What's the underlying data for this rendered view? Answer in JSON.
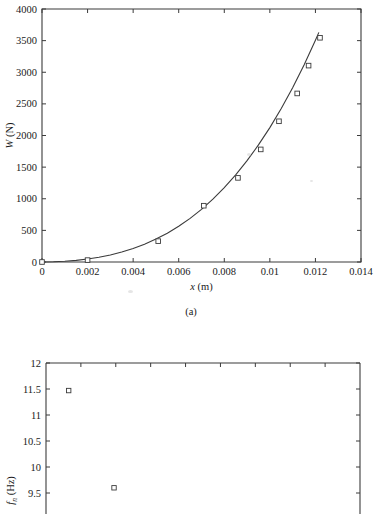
{
  "figure": {
    "caption_a": "(a)"
  },
  "chart_data": [
    {
      "id": "panel-a",
      "type": "scatter",
      "title": "",
      "xlabel": "x (m)",
      "xlabel_symbol": "x",
      "xlabel_unit": "(m)",
      "ylabel": "W (N)",
      "ylabel_symbol": "W",
      "ylabel_unit": "(N)",
      "xlim": [
        0,
        0.014
      ],
      "ylim": [
        0,
        4000
      ],
      "xticks": [
        0,
        0.002,
        0.004,
        0.006,
        0.008,
        0.01,
        0.012,
        0.014
      ],
      "xticklabels": [
        "0",
        "0.002",
        "0.004",
        "0.006",
        "0.008",
        "0.01",
        "0.012",
        "0.014"
      ],
      "yticks": [
        0,
        500,
        1000,
        1500,
        2000,
        2500,
        3000,
        3500,
        4000
      ],
      "yticklabels": [
        "0",
        "500",
        "1000",
        "1500",
        "2000",
        "2500",
        "3000",
        "3500",
        "4000"
      ],
      "grid": false,
      "legend": null,
      "marker": "open-square",
      "series": [
        {
          "name": "measured",
          "style": "markers",
          "x": [
            0.0,
            0.002,
            0.0051,
            0.0071,
            0.0086,
            0.0096,
            0.0104,
            0.0112,
            0.0117,
            0.0122
          ],
          "y": [
            0,
            30,
            330,
            890,
            1330,
            1780,
            2225,
            2665,
            3105,
            3545
          ]
        },
        {
          "name": "fitted curve",
          "style": "line",
          "x": [
            0.0,
            0.0005,
            0.001,
            0.0015,
            0.002,
            0.0025,
            0.003,
            0.0035,
            0.004,
            0.0045,
            0.005,
            0.0055,
            0.006,
            0.0065,
            0.007,
            0.0075,
            0.008,
            0.0085,
            0.009,
            0.0095,
            0.01,
            0.0105,
            0.011,
            0.0115,
            0.012,
            0.01215
          ],
          "y": [
            0,
            3,
            11,
            26,
            47,
            75,
            112,
            158,
            214,
            282,
            362,
            456,
            565,
            690,
            833,
            994,
            1175,
            1377,
            1602,
            1851,
            2125,
            2426,
            2756,
            3115,
            3506,
            3630
          ]
        }
      ]
    },
    {
      "id": "panel-b",
      "type": "scatter",
      "title": "",
      "xlabel": "",
      "ylabel": "f_n (Hz)",
      "ylabel_symbol": "f",
      "ylabel_subscript": "n",
      "ylabel_unit": "(Hz)",
      "ylim": [
        9,
        12
      ],
      "yticks": [
        9,
        9.5,
        10,
        10.5,
        11,
        11.5,
        12
      ],
      "yticklabels": [
        "9",
        "9.5",
        "10",
        "10.5",
        "11",
        "11.5",
        "12"
      ],
      "xlim": [
        0,
        9
      ],
      "xticks": [
        0,
        1,
        2,
        3,
        4,
        5,
        6,
        7,
        8,
        9
      ],
      "xticklabels": [],
      "grid": false,
      "legend": null,
      "marker": "open-square",
      "note": "panel cropped at bottom edge of screenshot",
      "series": [
        {
          "name": "natural frequency",
          "style": "markers",
          "x": [
            0.65,
            1.95
          ],
          "y": [
            11.47,
            9.6
          ]
        }
      ]
    }
  ]
}
